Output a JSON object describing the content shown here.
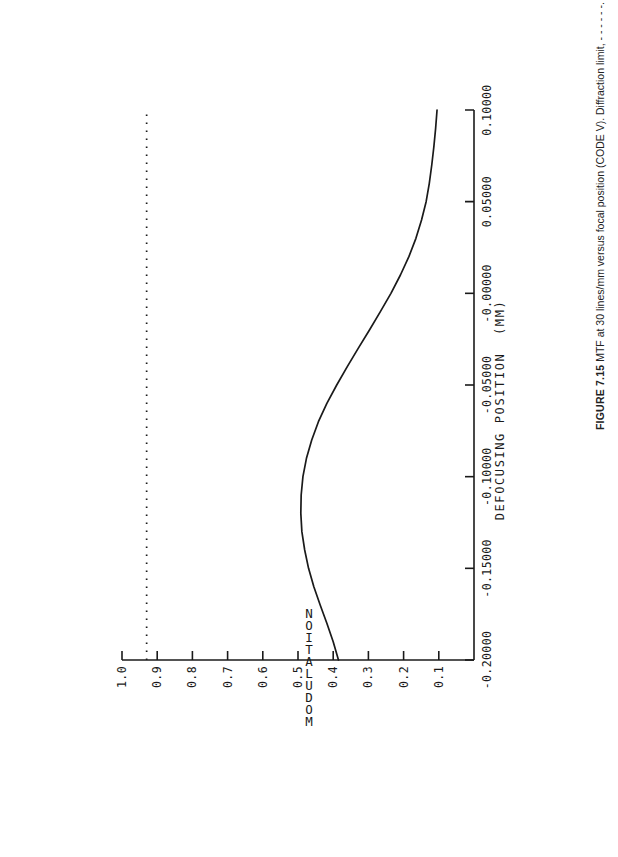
{
  "figure": {
    "caption_label": "FIGURE 7.15",
    "caption_text": "MTF at 30 lines/mm versus focal position (CODE V). Diffraction limit, - - - - - -.",
    "ink_color": "#1a1a1a",
    "background_color": "#ffffff"
  },
  "chart_data": {
    "type": "line",
    "title": "",
    "xlabel": "DEFOCUSING POSITION  (MM)",
    "ylabel": "MODULATION",
    "xlim": [
      -0.2,
      0.1
    ],
    "ylim": [
      0.0,
      1.0
    ],
    "grid": false,
    "legend_position": "none",
    "orientation": "rotated-90-ccw-on-page",
    "xticks": [
      -0.2,
      -0.15,
      -0.1,
      -0.05,
      -0.0,
      0.05,
      0.1
    ],
    "xticklabels": [
      "-0.20000",
      "-0.15000",
      "-0.10000",
      "-0.05000",
      "-0.00000",
      "0.05000",
      "0.10000"
    ],
    "yticks": [
      0.1,
      0.2,
      0.3,
      0.4,
      0.5,
      0.6,
      0.7,
      0.8,
      0.9,
      1.0
    ],
    "yticklabels": [
      "0.1",
      "0.2",
      "0.3",
      "0.4",
      "0.5",
      "0.6",
      "0.7",
      "0.8",
      "0.9",
      "1.0"
    ],
    "series": [
      {
        "name": "MTF at 30 lines/mm",
        "style": "solid",
        "color": "#1a1a1a",
        "x": [
          -0.2,
          -0.19,
          -0.18,
          -0.17,
          -0.16,
          -0.15,
          -0.14,
          -0.13,
          -0.12,
          -0.11,
          -0.1,
          -0.09,
          -0.08,
          -0.07,
          -0.06,
          -0.05,
          -0.04,
          -0.03,
          -0.02,
          -0.01,
          -0.0,
          0.01,
          0.02,
          0.03,
          0.04,
          0.05,
          0.06,
          0.07,
          0.08,
          0.09,
          0.1
        ],
        "y": [
          0.385,
          0.4,
          0.418,
          0.437,
          0.455,
          0.47,
          0.481,
          0.489,
          0.492,
          0.491,
          0.486,
          0.476,
          0.461,
          0.442,
          0.418,
          0.39,
          0.36,
          0.329,
          0.297,
          0.266,
          0.236,
          0.209,
          0.185,
          0.165,
          0.149,
          0.136,
          0.127,
          0.12,
          0.114,
          0.109,
          0.105
        ]
      },
      {
        "name": "Diffraction limit",
        "style": "dotted",
        "color": "#1a1a1a",
        "constant_y": 0.93,
        "x": [
          -0.2,
          0.1
        ],
        "y": [
          0.93,
          0.93
        ]
      }
    ]
  }
}
